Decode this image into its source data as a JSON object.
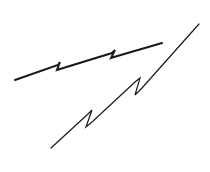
{
  "diagram": {
    "type": "break-lines",
    "description": "Two hand-drawn lines each with two Z-shaped break/zigzag marks",
    "stroke_color": "#1a1a1a",
    "background": "#ffffff",
    "lines": [
      {
        "name": "upper-break-line",
        "stroke_width": 2,
        "points": [
          [
            15,
            80
          ],
          [
            58,
            65
          ],
          [
            60,
            62
          ],
          [
            57,
            70
          ],
          [
            60,
            69
          ],
          [
            112,
            53
          ],
          [
            115,
            50
          ],
          [
            111,
            58
          ],
          [
            114,
            57
          ],
          [
            162,
            43
          ]
        ]
      },
      {
        "name": "lower-break-line",
        "stroke_width": 1.2,
        "points": [
          [
            51,
            148
          ],
          [
            88,
            114
          ],
          [
            92,
            110
          ],
          [
            86,
            127
          ],
          [
            92,
            122
          ],
          [
            135,
            82
          ],
          [
            140,
            78
          ],
          [
            135,
            95
          ],
          [
            142,
            88
          ],
          [
            199,
            24
          ]
        ]
      }
    ]
  }
}
